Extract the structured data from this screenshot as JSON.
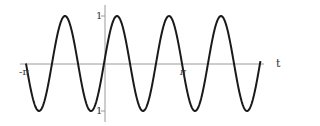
{
  "chart_data": {
    "type": "line",
    "title": "",
    "xlabel": "t",
    "ylabel": "",
    "function": "sin(3t)",
    "xlim": [
      -3.1416,
      6.3
    ],
    "ylim": [
      -1,
      1
    ],
    "x_ticks": [
      {
        "value": -3.1416,
        "label": "-π"
      },
      {
        "value": 3.1416,
        "label": "π"
      }
    ],
    "y_ticks": [
      {
        "value": 1,
        "label": "1"
      },
      {
        "value": -1,
        "label": "-1"
      }
    ],
    "grid": false,
    "legend": null,
    "series": [
      {
        "name": "sin(3t)",
        "color": "#1a1a1a",
        "x": [
          -3.1416,
          -2.618,
          -2.0944,
          -1.5708,
          -1.0472,
          -0.5236,
          0,
          0.5236,
          1.0472,
          1.5708,
          2.0944,
          2.618,
          3.1416,
          3.6652,
          4.1888,
          4.7124,
          5.236,
          5.7596,
          6.2832
        ],
        "y": [
          0,
          -1,
          0,
          1,
          0,
          -1,
          0,
          1,
          0,
          -1,
          0,
          1,
          0,
          -1,
          0,
          1,
          0,
          -1,
          0
        ]
      }
    ]
  },
  "labels": {
    "x_axis": "t",
    "neg_pi": "-π",
    "pi": "π",
    "y_one": "1",
    "y_neg_one": "1"
  },
  "colors": {
    "curve": "#1a1a1a",
    "axis": "#9a9a9a",
    "text": "#333333"
  }
}
